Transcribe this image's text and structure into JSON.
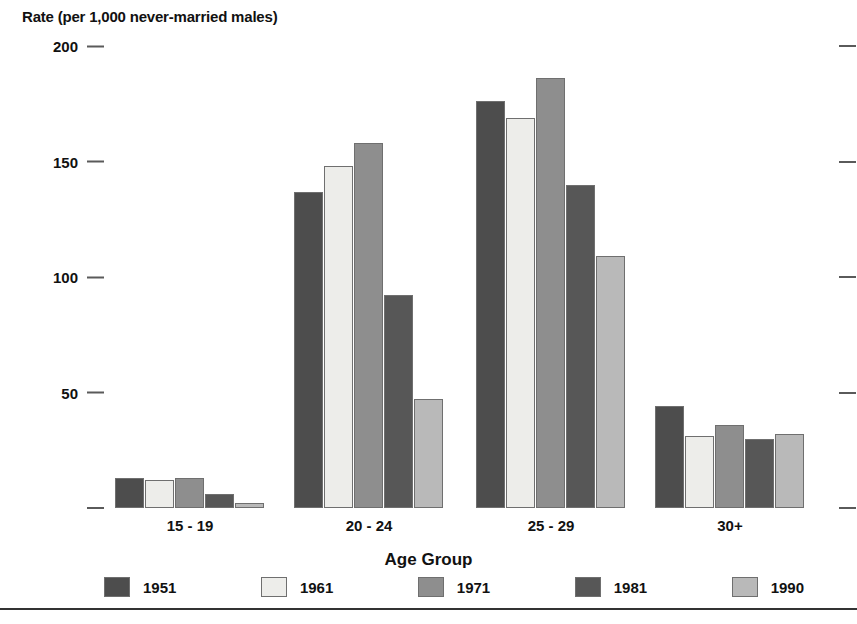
{
  "chart_data": {
    "type": "bar",
    "title": "",
    "ylabel": "Rate (per 1,000 never-married males)",
    "xlabel": "Age Group",
    "categories": [
      "15 - 19",
      "20 - 24",
      "25 - 29",
      "30+"
    ],
    "ylim": [
      0,
      200
    ],
    "yticks": [
      200,
      150,
      100,
      50,
      0
    ],
    "ytick_labels": [
      "200",
      "150",
      "100",
      "50",
      ""
    ],
    "grid": false,
    "legend_position": "bottom",
    "series": [
      {
        "name": "1951",
        "color": "#4d4d4d",
        "values": [
          13,
          137,
          176,
          44
        ]
      },
      {
        "name": "1961",
        "color": "#ededea",
        "values": [
          12,
          148,
          169,
          31
        ]
      },
      {
        "name": "1971",
        "color": "#8e8e8e",
        "values": [
          13,
          158,
          186,
          36
        ]
      },
      {
        "name": "1981",
        "color": "#575757",
        "values": [
          6,
          92,
          140,
          30
        ]
      },
      {
        "name": "1990",
        "color": "#b9b9b9",
        "values": [
          2,
          47,
          109,
          32
        ]
      }
    ]
  },
  "axes": {
    "y_title": "Rate (per 1,000 never-married males)",
    "x_title": "Age Group"
  }
}
